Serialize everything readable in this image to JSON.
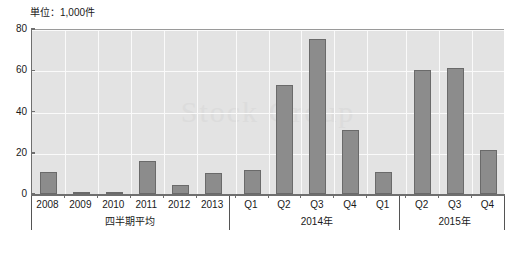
{
  "caption": {
    "unit_label": "単位：1,000件"
  },
  "watermark": {
    "text": "Stock Group"
  },
  "axis": {
    "y_ticks": [
      "0",
      "20",
      "40",
      "60",
      "80"
    ],
    "y_tick_values": [
      0,
      20,
      40,
      60,
      80
    ]
  },
  "groups": [
    {
      "label": "四半期平均",
      "start": 0,
      "end": 5
    },
    {
      "label": "2014年",
      "start": 6,
      "end": 10
    },
    {
      "label": "2015年",
      "start": 11,
      "end": 13
    }
  ],
  "chart_data": {
    "type": "bar",
    "title": "",
    "subtitle": "",
    "xlabel": "",
    "ylabel": "単位：1,000件",
    "ylim": [
      0,
      80
    ],
    "grid": true,
    "legend": "none",
    "series_color": "#8c8c8c",
    "plot_background": "#e3e3e3",
    "gridline_color": "#fafafa",
    "categories": [
      "2008",
      "2009",
      "2010",
      "2011",
      "2012",
      "2013",
      "Q1",
      "Q2",
      "Q3",
      "Q4",
      "Q1",
      "Q2",
      "Q3",
      "Q4"
    ],
    "values": [
      10.5,
      0.4,
      1.2,
      16.0,
      4.2,
      10.3,
      11.5,
      53.0,
      75.0,
      31.0,
      10.5,
      60.0,
      61.0,
      21.5
    ],
    "group_labels": [
      "四半期平均",
      "2014年",
      "2015年"
    ],
    "group_spans": [
      [
        0,
        5
      ],
      [
        6,
        10
      ],
      [
        11,
        13
      ]
    ]
  }
}
